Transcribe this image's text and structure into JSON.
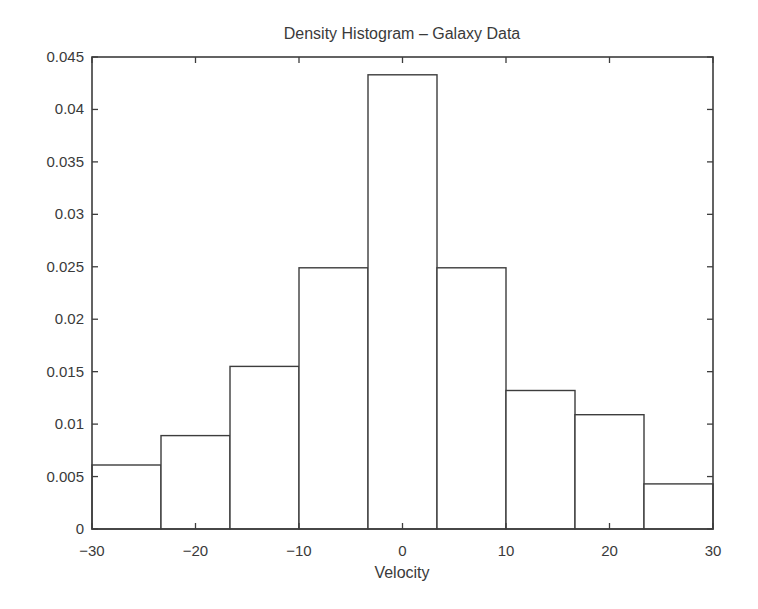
{
  "figure": {
    "background": "#ffffff",
    "line_color": "#3d3d3d",
    "text_color": "#3a3a3a"
  },
  "chart_data": {
    "type": "bar",
    "subtype": "density-histogram",
    "title": "Density Histogram – Galaxy Data",
    "xlabel": "Velocity",
    "ylabel": "",
    "xlim": [
      -30,
      30
    ],
    "ylim": [
      0,
      0.045
    ],
    "grid": false,
    "legend_position": "none",
    "bin_edges": [
      -30,
      -23.333,
      -16.667,
      -10,
      -3.333,
      3.333,
      10,
      16.667,
      23.333,
      30
    ],
    "densities": [
      0.0061,
      0.0089,
      0.0155,
      0.0249,
      0.0433,
      0.0249,
      0.0132,
      0.0109,
      0.0043
    ],
    "x_ticks": {
      "values": [
        -30,
        -20,
        -10,
        0,
        10,
        20,
        30
      ],
      "labels": [
        "−30",
        "−20",
        "−10",
        "0",
        "10",
        "20",
        "30"
      ]
    },
    "y_ticks": {
      "values": [
        0,
        0.005,
        0.01,
        0.015,
        0.02,
        0.025,
        0.03,
        0.035,
        0.04,
        0.045
      ],
      "labels": [
        "0",
        "0.005",
        "0.01",
        "0.015",
        "0.02",
        "0.025",
        "0.03",
        "0.035",
        "0.04",
        "0.045"
      ]
    },
    "bar_fill": "#ffffff",
    "bar_stroke": "#3d3d3d"
  }
}
